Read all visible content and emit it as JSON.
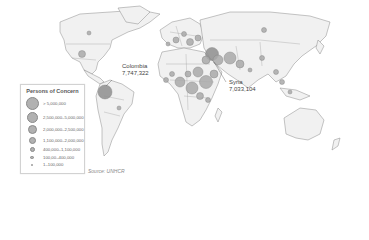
{
  "map": {
    "title": "Persons of Concern",
    "colors": {
      "land": "#f1f1f1",
      "border": "#8a8a8a",
      "bubble": "#a9a9a9",
      "background": "#ffffff"
    },
    "callouts": [
      {
        "country": "Colombia",
        "value": "7,747,322"
      },
      {
        "country": "Syria",
        "value": "7,033,104"
      }
    ],
    "source": "Source: UNHCR"
  },
  "legend": {
    "title": "Persons of Concern",
    "items": [
      {
        "label": "> 5,000,000",
        "size": 13
      },
      {
        "label": "2,500,000–5,000,000",
        "size": 11
      },
      {
        "label": "2,000,000–2,500,000",
        "size": 9
      },
      {
        "label": "1,100,000–2,000,000",
        "size": 7
      },
      {
        "label": "400,000–1,100,000",
        "size": 5
      },
      {
        "label": "100,00–400,000",
        "size": 3.5
      },
      {
        "label": "1–100,000",
        "size": 2
      }
    ]
  }
}
